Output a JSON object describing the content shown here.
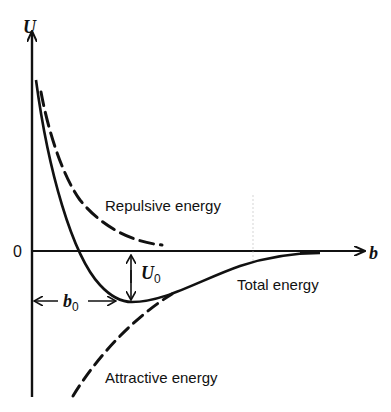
{
  "diagram": {
    "axes": {
      "y_label": "U",
      "x_label": "b",
      "origin_label": "0"
    },
    "curves": {
      "repulsive": {
        "label": "Repulsive energy",
        "style": "dashed"
      },
      "attractive": {
        "label": "Attractive energy",
        "style": "dashed"
      },
      "total": {
        "label": "Total energy",
        "style": "solid"
      }
    },
    "annotations": {
      "well_depth": {
        "symbol": "U",
        "subscript": "0"
      },
      "equilibrium_distance": {
        "symbol": "b",
        "subscript": "0"
      }
    },
    "colors": {
      "ink": "#111111",
      "background": "#ffffff"
    }
  }
}
